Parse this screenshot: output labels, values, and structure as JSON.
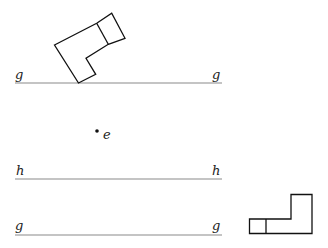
{
  "diagram": {
    "lines": [
      {
        "id": "g-top",
        "label_left": "g",
        "label_right": "g",
        "y": 83,
        "x1": 15,
        "x2": 222
      },
      {
        "id": "h",
        "label_left": "h",
        "label_right": "h",
        "y": 179,
        "x1": 15,
        "x2": 222
      },
      {
        "id": "g-bottom",
        "label_left": "g",
        "label_right": "g",
        "y": 235,
        "x1": 15,
        "x2": 222
      }
    ],
    "point": {
      "label": "e",
      "x": 97,
      "y": 131
    },
    "shapes": [
      {
        "id": "tilted-l-shape",
        "description": "L-shaped figure tilted, touching line g at one vertex"
      },
      {
        "id": "upright-l-shape",
        "description": "L-shaped figure resting upright to the right of bottom line g"
      }
    ],
    "colors": {
      "lines": "#8a8a8a",
      "shapes": "#111111",
      "background": "#ffffff"
    }
  }
}
